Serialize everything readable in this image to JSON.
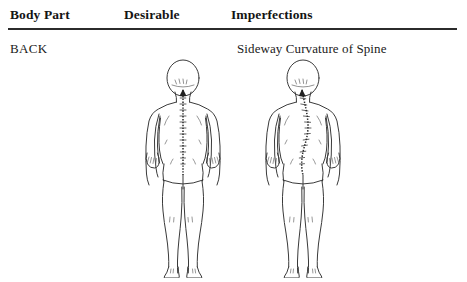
{
  "table": {
    "columns": [
      {
        "id": "body-part",
        "label": "Body Part"
      },
      {
        "id": "desirable",
        "label": "Desirable"
      },
      {
        "id": "imperfections",
        "label": "Imperfections"
      }
    ],
    "rows": [
      {
        "body_part": "BACK",
        "desirable_caption": "",
        "imperfection_caption": "Sideway Curvature of Spine",
        "desirable_figure": {
          "name": "male-back-straight-spine",
          "spine": "straight-vertical"
        },
        "imperfection_figure": {
          "name": "male-back-curved-spine",
          "spine": "s-curve-scoliosis"
        }
      }
    ]
  },
  "style": {
    "page_background": "#ffffff",
    "text_color": "#1a1a1a",
    "rule_color": "#2b2b2b",
    "figure_stroke": "#3a3a3a",
    "spine_color": "#2a2a2a"
  }
}
